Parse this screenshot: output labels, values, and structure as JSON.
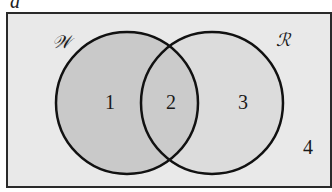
{
  "panel_label": "a",
  "diagram": {
    "type": "venn",
    "universe": {
      "x": 7,
      "y": 13,
      "width": 324,
      "height": 174,
      "fill": "#e9e9e9",
      "stroke": "#2a2a2a"
    },
    "sets": [
      {
        "name": "W",
        "label": "𝒲",
        "cx": 127,
        "cy": 103,
        "r": 71,
        "fill": "#c9c9c9",
        "label_x": 52,
        "label_y": 48
      },
      {
        "name": "R",
        "label": "ℛ",
        "cx": 212,
        "cy": 103,
        "r": 71,
        "fill": "#dcdcdc",
        "label_x": 276,
        "label_y": 46
      }
    ],
    "intersection_fill": "#cbcbcb",
    "stroke_color": "#111111",
    "regions": [
      {
        "id": "1",
        "label": "1",
        "x": 105,
        "y": 109
      },
      {
        "id": "2",
        "label": "2",
        "x": 166,
        "y": 109
      },
      {
        "id": "3",
        "label": "3",
        "x": 238,
        "y": 109
      },
      {
        "id": "4",
        "label": "4",
        "x": 303,
        "y": 154
      }
    ]
  }
}
